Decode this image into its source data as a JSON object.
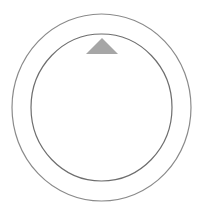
{
  "dial": {
    "outer_ring": {
      "cx": 101.5,
      "cy": 107.5,
      "rx": 89.5,
      "ry": 93.5,
      "stroke": "#8a8a8a"
    },
    "inner_ring": {
      "cx": 101.5,
      "cy": 107.5,
      "rx": 70.5,
      "ry": 73.5,
      "stroke": "#6e6e6e"
    },
    "indicator": {
      "icon": "triangle-up-icon",
      "points": "86,54 102,38 118,54",
      "fill": "#a6a6a6"
    },
    "background": "#ffffff"
  }
}
